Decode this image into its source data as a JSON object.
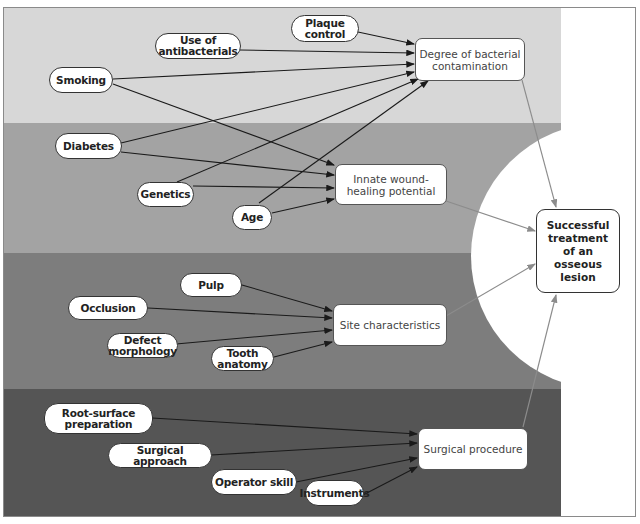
{
  "diagram": {
    "colors": {
      "band_1": "#d7d7d7",
      "band_2": "#a3a3a3",
      "band_3": "#7d7d7d",
      "band_4": "#555555",
      "arrow_black": "#1a1a1a",
      "arrow_gray": "#8c8c8c",
      "background": "#ffffff"
    },
    "outcome": {
      "label": "Successful treatment of an osseous lesion"
    },
    "groups": [
      {
        "hub": "Degree of bacterial contamination",
        "factors": [
          "Plaque control",
          "Use of antibacterials",
          "Smoking",
          "Diabetes",
          "Genetics",
          "Age"
        ]
      },
      {
        "hub": "Innate wound-healing potential",
        "factors": [
          "Smoking",
          "Diabetes",
          "Genetics",
          "Age"
        ]
      },
      {
        "hub": "Site characteristics",
        "factors": [
          "Pulp",
          "Occlusion",
          "Defect morphology",
          "Tooth anatomy"
        ]
      },
      {
        "hub": "Surgical procedure",
        "factors": [
          "Root-surface preparation",
          "Surgical approach",
          "Operator skill",
          "Instruments"
        ]
      }
    ],
    "nodes": {
      "plaque_control": "Plaque control",
      "antibacterials": "Use of antibacterials",
      "smoking": "Smoking",
      "diabetes": "Diabetes",
      "genetics": "Genetics",
      "age": "Age",
      "pulp": "Pulp",
      "occlusion": "Occlusion",
      "defect_morphology": "Defect morphology",
      "tooth_anatomy": "Tooth anatomy",
      "root_surface": "Root-surface preparation",
      "surgical_approach": "Surgical approach",
      "operator_skill": "Operator skill",
      "instruments": "Instruments"
    },
    "hubs": {
      "bacterial": "Degree of bacterial contamination",
      "wound_healing": "Innate wound-healing potential",
      "site": "Site characteristics",
      "surgical": "Surgical procedure"
    }
  }
}
